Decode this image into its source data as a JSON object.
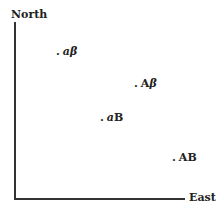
{
  "axes": {
    "y_label": "North",
    "x_label": "East"
  },
  "points": [
    {
      "id": "a-beta",
      "prefix": "a",
      "suffix": "β",
      "prefix_italic": true,
      "x": 56,
      "y": 46
    },
    {
      "id": "A-beta",
      "prefix": "A",
      "suffix": "β",
      "prefix_italic": false,
      "x": 134,
      "y": 78
    },
    {
      "id": "a-B",
      "prefix": "a",
      "suffix": "B",
      "prefix_italic": true,
      "x": 100,
      "y": 112
    },
    {
      "id": "A-B",
      "prefix": "A",
      "suffix": "B",
      "prefix_italic": false,
      "x": 172,
      "y": 152
    }
  ],
  "dot": "."
}
